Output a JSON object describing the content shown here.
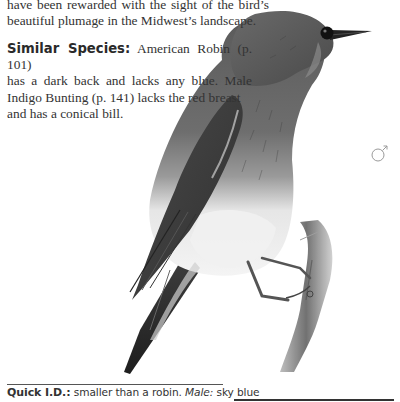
{
  "page": {
    "intro_lines": [
      "have been rewarded with the sight of the bird’s",
      "beautiful plumage in the Midwest’s landscape."
    ],
    "similar_species": {
      "heading": "Similar Species:",
      "lines": [
        " American Robin (p. 101)",
        "has a dark back and lacks any blue. Male",
        "Indigo Bunting (p. 141) lacks the red breast",
        "and has a conical bill."
      ]
    },
    "illustration": {
      "subject": "Eastern Bluebird (male) perched on a branch",
      "style": "grayscale pencil illustration",
      "sex_symbol": "♂",
      "sex_label": "male"
    },
    "quick_id": {
      "label": "Quick I.D.:",
      "text_before": " smaller than a robin. ",
      "male_label": "Male:",
      "text_after": " sky blue"
    }
  }
}
